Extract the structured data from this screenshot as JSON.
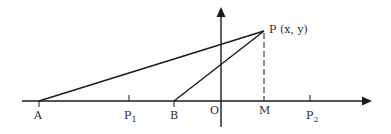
{
  "diagram": {
    "type": "coordinate-geometry",
    "axes": {
      "origin_label": "O",
      "x_axis": {
        "from": [
          22,
          101
        ],
        "to": [
          372,
          101
        ]
      },
      "y_axis": {
        "from": [
          221,
          127
        ],
        "to": [
          221,
          8
        ]
      }
    },
    "points": [
      {
        "id": "A",
        "label": "A",
        "sub": "",
        "x": 39,
        "y": 101
      },
      {
        "id": "P1",
        "label": "P",
        "sub": "1",
        "x": 129,
        "y": 101
      },
      {
        "id": "B",
        "label": "B",
        "sub": "",
        "x": 174,
        "y": 101
      },
      {
        "id": "M",
        "label": "M",
        "sub": "",
        "x": 264,
        "y": 101
      },
      {
        "id": "P2",
        "label": "P",
        "sub": "2",
        "x": 310,
        "y": 101
      }
    ],
    "point_P": {
      "label": "P (x, y)",
      "x": 264,
      "y": 31
    },
    "segments": [
      {
        "from": "A",
        "to": "P",
        "style": "solid"
      },
      {
        "from": "B",
        "to": "P",
        "style": "solid"
      },
      {
        "from": "P",
        "to": "M",
        "style": "dashed"
      }
    ],
    "colors": {
      "stroke": "#1a1a1a",
      "text": "#2a2a2a",
      "background": "#ffffff"
    }
  }
}
